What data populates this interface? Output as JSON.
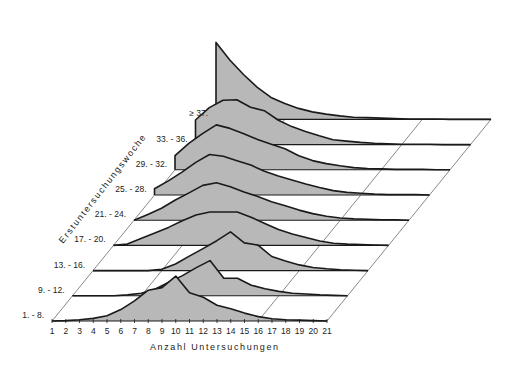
{
  "chart_data": {
    "type": "area",
    "subtype": "3d-ridgeline",
    "title": "",
    "xlabel": "Anzahl Untersuchungen",
    "ylabel": "Erstuntersuchungswoche",
    "x": [
      1,
      2,
      3,
      4,
      5,
      6,
      7,
      8,
      9,
      10,
      11,
      12,
      13,
      14,
      15,
      16,
      17,
      18,
      19,
      20,
      21
    ],
    "xlim": [
      1,
      21
    ],
    "series": [
      {
        "name": "1. - 8.",
        "values": [
          0,
          0.1,
          0.3,
          0.6,
          1.2,
          2.6,
          4.6,
          7.0,
          7.6,
          10.2,
          6.4,
          5.4,
          3.6,
          2.8,
          1.8,
          1.0,
          0.5,
          0.3,
          0.2,
          0.1,
          0
        ]
      },
      {
        "name": "9. - 12.",
        "values": [
          0,
          0,
          0,
          0,
          0.2,
          0.6,
          1.5,
          3.1,
          4.6,
          6.4,
          8.0,
          4.0,
          4.0,
          2.4,
          1.6,
          1.0,
          0.6,
          0.4,
          0.2,
          0.1,
          0
        ]
      },
      {
        "name": "13. - 16.",
        "values": [
          0,
          0,
          0,
          0,
          0,
          0.3,
          1.5,
          3.3,
          5.0,
          6.8,
          8.8,
          6.3,
          5.8,
          3.2,
          2.2,
          1.3,
          0.7,
          0.4,
          0.2,
          0.1,
          0
        ]
      },
      {
        "name": "17. - 20.",
        "values": [
          0,
          0.3,
          1.6,
          2.8,
          4.1,
          5.6,
          6.9,
          7.6,
          7.6,
          7.6,
          6.4,
          5.0,
          3.6,
          2.6,
          1.8,
          1.0,
          0.5,
          0.3,
          0.2,
          0.1,
          0
        ]
      },
      {
        "name": "21. - 24.",
        "values": [
          0,
          1.3,
          2.7,
          4.6,
          6.2,
          7.9,
          8.5,
          7.6,
          6.4,
          5.4,
          4.2,
          3.3,
          2.3,
          1.5,
          0.9,
          0.5,
          0.3,
          0.2,
          0.1,
          0.1,
          0
        ]
      },
      {
        "name": "25. - 28.",
        "values": [
          1.4,
          3.2,
          5.2,
          7.4,
          9.2,
          8.8,
          7.8,
          6.8,
          5.4,
          4.3,
          3.4,
          2.5,
          1.7,
          1.0,
          0.6,
          0.4,
          0.2,
          0.1,
          0.1,
          0.1,
          0
        ]
      },
      {
        "name": "29. - 32.",
        "values": [
          3.2,
          6.0,
          8.2,
          10.2,
          9.4,
          8.2,
          6.9,
          5.8,
          4.8,
          3.2,
          2.1,
          1.4,
          0.9,
          0.5,
          0.3,
          0.2,
          0.1,
          0.1,
          0.1,
          0,
          0
        ]
      },
      {
        "name": "33. - 36.",
        "values": [
          5.6,
          8.4,
          10.1,
          10.2,
          8.5,
          7.7,
          5.6,
          4.1,
          3.0,
          2.0,
          1.1,
          0.8,
          0.5,
          0.3,
          0.2,
          0.1,
          0.1,
          0.1,
          0,
          0,
          0
        ]
      },
      {
        "name": "≥ 37.",
        "values": [
          17.5,
          13.5,
          10.2,
          7.3,
          5.0,
          3.6,
          2.5,
          1.7,
          1.2,
          0.8,
          0.5,
          0.4,
          0.3,
          0.2,
          0.1,
          0.1,
          0.1,
          0,
          0,
          0,
          0
        ]
      }
    ],
    "grid": "diagonal lines at x=6 and x=16 through depth",
    "legend": "none (row labels on left diagonal)"
  },
  "axes": {
    "x_title": "Anzahl Untersuchungen",
    "depth_title": "Erstuntersuchungswoche",
    "x_ticks": [
      "1",
      "2",
      "3",
      "4",
      "5",
      "6",
      "7",
      "8",
      "9",
      "10",
      "11",
      "12",
      "13",
      "14",
      "15",
      "16",
      "17",
      "18",
      "19",
      "20",
      "21"
    ]
  },
  "rows": [
    "1. - 8.",
    "9. - 12.",
    "13. - 16.",
    "17. - 20.",
    "21. - 24.",
    "25. - 28.",
    "29. - 32.",
    "33. - 36.",
    "≥ 37."
  ],
  "colors": {
    "fill": "#b8b8b8",
    "line": "#1a1a1a",
    "grid": "#555555",
    "background": "#ffffff"
  }
}
